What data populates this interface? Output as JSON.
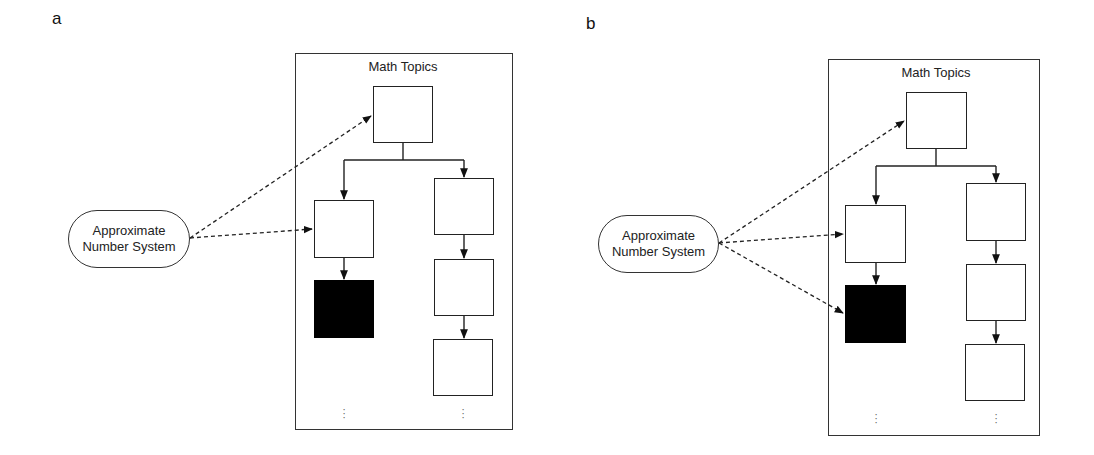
{
  "panels": [
    {
      "label": "a",
      "container_title": "Math Topics",
      "source_node": {
        "line1": "Approximate",
        "line2": "Number System"
      },
      "continuation_marker": "⋮",
      "nodes": [
        {
          "id": "top",
          "filled": false
        },
        {
          "id": "left-1",
          "filled": false
        },
        {
          "id": "left-2",
          "filled": true
        },
        {
          "id": "right-1",
          "filled": false
        },
        {
          "id": "right-2",
          "filled": false
        },
        {
          "id": "right-3",
          "filled": false
        }
      ],
      "dashed_links": [
        "top",
        "left-1"
      ]
    },
    {
      "label": "b",
      "container_title": "Math Topics",
      "source_node": {
        "line1": "Approximate",
        "line2": "Number System"
      },
      "continuation_marker": "⋮",
      "nodes": [
        {
          "id": "top",
          "filled": false
        },
        {
          "id": "left-1",
          "filled": false
        },
        {
          "id": "left-2",
          "filled": true
        },
        {
          "id": "right-1",
          "filled": false
        },
        {
          "id": "right-2",
          "filled": false
        },
        {
          "id": "right-3",
          "filled": false
        }
      ],
      "dashed_links": [
        "top",
        "left-1",
        "left-2"
      ]
    }
  ],
  "colors": {
    "line": "#222222",
    "filled_node": "#000000",
    "background": "#ffffff"
  }
}
